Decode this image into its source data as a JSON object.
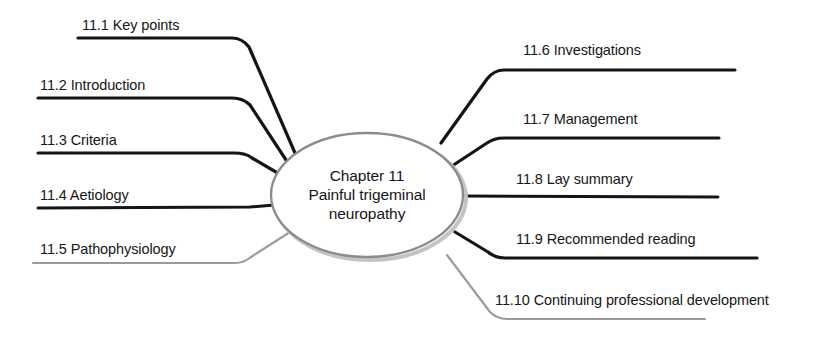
{
  "diagram": {
    "type": "mind-map",
    "center": {
      "line1": "Chapter 11",
      "line2": "Painful trigeminal",
      "line3": "neuropathy",
      "shape": "ellipse",
      "outline_color": "#8c8c8c",
      "fill_color": "#ffffff",
      "cx": 367,
      "cy": 195,
      "rx": 96,
      "ry": 62
    },
    "colors": {
      "background": "#ffffff",
      "text": "#161616",
      "branch_dark": "#151515",
      "branch_light": "#9a9a9a",
      "ellipse_stroke": "#8c8c8c",
      "ellipse_shadow": "#c9c9c9"
    },
    "branches_left": [
      {
        "id": "11.1",
        "label": "11.1 Key points",
        "side": "left",
        "stroke": "#151515",
        "stroke_width": 3.2,
        "label_x": 82,
        "label_y": 18,
        "path": "M 78 38 L 232 38 Q 242 38 249 47 L 295 153",
        "line_start_x": 78,
        "line_y": 38
      },
      {
        "id": "11.2",
        "label": "11.2 Introduction",
        "side": "left",
        "stroke": "#151515",
        "stroke_width": 3.2,
        "label_x": 40,
        "label_y": 78,
        "path": "M 38 98 L 232 98 Q 243 98 250 105 L 288 163",
        "line_start_x": 38,
        "line_y": 98
      },
      {
        "id": "11.3",
        "label": "11.3 Criteria",
        "side": "left",
        "stroke": "#151515",
        "stroke_width": 3.2,
        "label_x": 40,
        "label_y": 133,
        "path": "M 38 153 L 234 153 Q 246 153 252 158 L 281 175",
        "line_start_x": 38,
        "line_y": 153
      },
      {
        "id": "11.4",
        "label": "11.4 Aetiology",
        "side": "left",
        "stroke": "#151515",
        "stroke_width": 3.0,
        "label_x": 40,
        "label_y": 188,
        "path": "M 38 208 L 250 207 L 274 205",
        "line_start_x": 38,
        "line_y": 208
      },
      {
        "id": "11.5",
        "label": "11.5 Pathophysiology",
        "side": "left",
        "stroke": "#9a9a9a",
        "stroke_width": 2.1,
        "label_x": 40,
        "label_y": 242,
        "path": "M 33 263 L 235 263 Q 244 263 251 257 L 290 232",
        "line_start_x": 33,
        "line_y": 263
      }
    ],
    "branches_right": [
      {
        "id": "11.6",
        "label": "11.6 Investigations",
        "side": "right",
        "stroke": "#151515",
        "stroke_width": 3.2,
        "label_x": 523,
        "label_y": 43,
        "path": "M 735 70 L 504 70 Q 494 70 487 79 L 441 143",
        "line_end_x": 735,
        "line_y": 70
      },
      {
        "id": "11.7",
        "label": "11.7 Management",
        "side": "right",
        "stroke": "#151515",
        "stroke_width": 3.2,
        "label_x": 523,
        "label_y": 112,
        "path": "M 719 138 L 504 138 Q 494 138 487 143 L 452 166",
        "line_end_x": 719,
        "line_y": 138
      },
      {
        "id": "11.8",
        "label": "11.8 Lay summary",
        "side": "right",
        "stroke": "#151515",
        "stroke_width": 3.0,
        "label_x": 516,
        "label_y": 172,
        "path": "M 718 197 L 463 196",
        "line_end_x": 718,
        "line_y": 197
      },
      {
        "id": "11.9",
        "label": "11.9 Recommended reading",
        "side": "right",
        "stroke": "#151515",
        "stroke_width": 3.2,
        "label_x": 516,
        "label_y": 232,
        "path": "M 757 258 L 505 258 Q 495 258 488 252 L 455 232",
        "line_end_x": 757,
        "line_y": 258
      },
      {
        "id": "11.10",
        "label": "11.10 Continuing professional development",
        "side": "right",
        "stroke": "#9a9a9a",
        "stroke_width": 2.1,
        "label_x": 495,
        "label_y": 293,
        "path": "M 705 319 L 507 319 Q 497 319 490 312 L 447 255",
        "line_end_x": 705,
        "line_y": 319
      }
    ]
  }
}
